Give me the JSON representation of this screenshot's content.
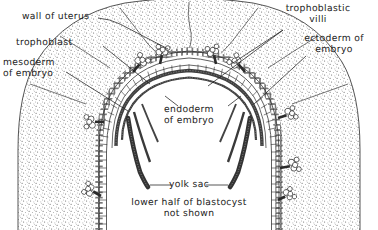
{
  "figure": {
    "type": "anatomical-cross-section",
    "background_color": "#ffffff",
    "ink_color": "#1a1a1a",
    "stipple_color": "#555555"
  },
  "labels": {
    "wall_of_uterus": "wall of uterus",
    "trophoblast": "trophoblast",
    "mesoderm_of_embryo": "mesoderm\nof embryo",
    "trophoblastic_villi": "trophoblastic\nvilli",
    "ectoderm_of_embryo": "ectoderm of\nembryo",
    "endoderm_of_embryo": "endoderm\nof embryo",
    "yolk_sac": "yolk sac",
    "caption": "lower half of blastocyst\nnot shown"
  },
  "structures": [
    {
      "name": "wall-of-uterus",
      "description": "stippled endometrial tissue forming outer dome"
    },
    {
      "name": "trophoblast",
      "description": "outer single row of cuboidal cells lining the blastocyst"
    },
    {
      "name": "mesoderm-of-embryo",
      "description": "layer beneath trophoblast"
    },
    {
      "name": "ectoderm-of-embryo",
      "description": "dark inner cell layer of embryonic disc"
    },
    {
      "name": "endoderm-of-embryo",
      "description": "innermost cell layer continuous with yolk sac"
    },
    {
      "name": "yolk-sac",
      "description": "inner cellular arc enclosing the yolk sac cavity"
    },
    {
      "name": "trophoblastic-villi",
      "description": "branching cell clusters projecting into uterine wall"
    }
  ]
}
